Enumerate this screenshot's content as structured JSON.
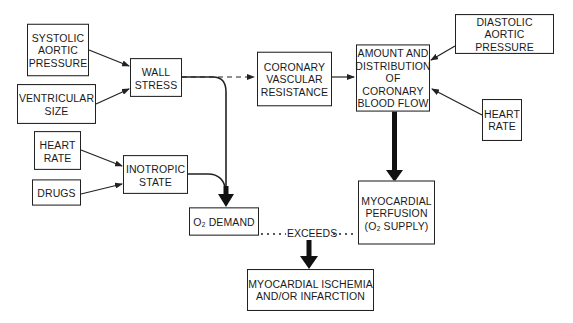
{
  "diagram": {
    "nodes": {
      "systolic_aortic_pressure": "SYSTOLIC\nAORTIC\nPRESSURE",
      "ventricular_size": "VENTRICULAR\nSIZE",
      "wall_stress": "WALL\nSTRESS",
      "heart_rate_left": "HEART\nRATE",
      "drugs": "DRUGS",
      "inotropic_state": "INOTROPIC\nSTATE",
      "o2_demand": "O₂ DEMAND",
      "coronary_vascular_resistance": "CORONARY\nVASCULAR\nRESISTANCE",
      "coronary_blood_flow": "AMOUNT AND\nDISTRIBUTION\nOF CORONARY\nBLOOD FLOW",
      "diastolic_aortic_pressure": "DIASTOLIC\nAORTIC PRESSURE",
      "heart_rate_right": "HEART\nRATE",
      "myocardial_perfusion": "MYOCARDIAL\nPERFUSION\n(O₂ SUPPLY)",
      "ischemia": "MYOCARDIAL ISCHEMIA\nAND/OR INFARCTION"
    },
    "exceeds_label": "EXCEEDS",
    "edges": [
      {
        "from": "systolic_aortic_pressure",
        "to": "wall_stress",
        "style": "thin"
      },
      {
        "from": "ventricular_size",
        "to": "wall_stress",
        "style": "thin"
      },
      {
        "from": "wall_stress",
        "to": "coronary_vascular_resistance",
        "style": "dashed"
      },
      {
        "from": "wall_stress",
        "to": "o2_demand",
        "style": "thick"
      },
      {
        "from": "heart_rate_left",
        "to": "inotropic_state",
        "style": "thin"
      },
      {
        "from": "drugs",
        "to": "inotropic_state",
        "style": "thin"
      },
      {
        "from": "inotropic_state",
        "to": "o2_demand",
        "style": "thick"
      },
      {
        "from": "coronary_vascular_resistance",
        "to": "coronary_blood_flow",
        "style": "thin"
      },
      {
        "from": "diastolic_aortic_pressure",
        "to": "coronary_blood_flow",
        "style": "thin"
      },
      {
        "from": "heart_rate_right",
        "to": "coronary_blood_flow",
        "style": "thin"
      },
      {
        "from": "coronary_blood_flow",
        "to": "myocardial_perfusion",
        "style": "thick"
      },
      {
        "from": "o2_demand",
        "to": "myocardial_perfusion",
        "style": "dotted",
        "label": "EXCEEDS"
      },
      {
        "from": "exceeds",
        "to": "ischemia",
        "style": "thick"
      }
    ]
  }
}
